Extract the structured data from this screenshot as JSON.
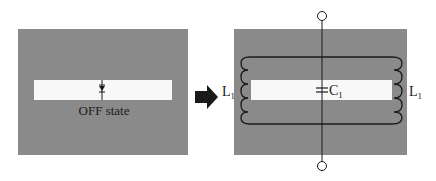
{
  "colors": {
    "panel": "#8a8a8a",
    "slot": "#f8f8f8",
    "line": "#1a1a1a",
    "arrow": "#1a1a1a",
    "background": "#ffffff"
  },
  "left_panel": {
    "component": "diode",
    "state_label": "OFF state"
  },
  "transition": {
    "icon": "right-arrow-icon"
  },
  "right_panel": {
    "capacitor_label": "C",
    "capacitor_subscript": "1",
    "inductor_left_label": "L",
    "inductor_left_subscript": "1",
    "inductor_right_label": "L",
    "inductor_right_subscript": "1",
    "terminals": 2
  }
}
